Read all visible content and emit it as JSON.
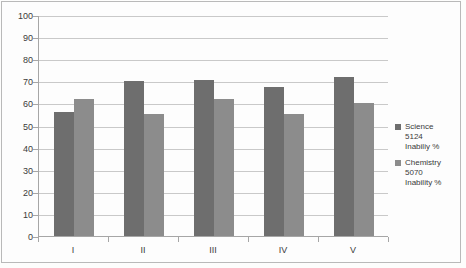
{
  "chart_data": {
    "type": "bar",
    "title": "",
    "subtitle": "",
    "xlabel": "",
    "ylabel": "",
    "categories": [
      "I",
      "II",
      "III",
      "IV",
      "V"
    ],
    "ylim": [
      0,
      100
    ],
    "yticks": [
      0,
      10,
      20,
      30,
      40,
      50,
      60,
      70,
      80,
      90,
      100
    ],
    "grid": true,
    "legend_position": "right",
    "series": [
      {
        "name": "Science 5124 Inabiliy %",
        "color": "#6e6e6e",
        "values": [
          56,
          70,
          70.5,
          67.5,
          72
        ]
      },
      {
        "name": "Chemistry 5070 Inability %",
        "color": "#8c8c8c",
        "values": [
          62,
          55,
          62,
          55,
          60
        ]
      }
    ]
  },
  "legend": {
    "entries": [
      {
        "line1": "Science",
        "line2": "5124",
        "line3": "Inabiliy %",
        "color": "#6e6e6e"
      },
      {
        "line1": "Chemistry",
        "line2": "5070",
        "line3": "Inability %",
        "color": "#8c8c8c"
      }
    ]
  }
}
